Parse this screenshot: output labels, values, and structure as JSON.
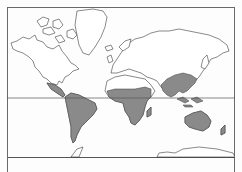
{
  "figure": {
    "type": "world-map",
    "projection": "mercator",
    "shaded_region_label": "tropical zone",
    "reference_lines": [
      "equator"
    ],
    "caption": "",
    "colors": {
      "land_fill": "#ffffff",
      "coastline": "#3a3a3a",
      "shaded_fill": "#8a8a8a",
      "equator_line": "#555555",
      "frame": "#6a6a6a",
      "background": "#fdfdfd"
    },
    "shaded_regions": [
      "Central America",
      "Northern South America",
      "Sub-Saharan Africa",
      "South and Southeast Asia",
      "Maritime Southeast Asia",
      "Australia"
    ]
  }
}
